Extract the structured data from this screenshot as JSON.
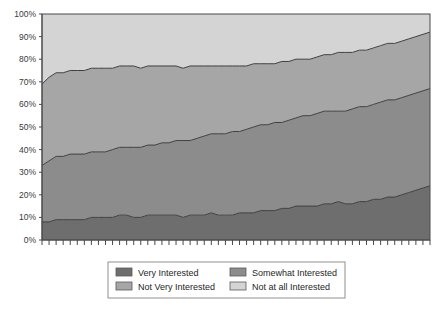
{
  "chart_data": {
    "type": "area",
    "stacked": true,
    "stack_mode": "percent",
    "title": "",
    "subtitle": "",
    "xlabel": "",
    "ylabel": "",
    "ylim": [
      0,
      100
    ],
    "ytick_labels": [
      "0%",
      "10%",
      "20%",
      "30%",
      "40%",
      "50%",
      "60%",
      "70%",
      "80%",
      "90%",
      "100%"
    ],
    "ytick_values": [
      0,
      10,
      20,
      30,
      40,
      50,
      60,
      70,
      80,
      90,
      100
    ],
    "grid": false,
    "xtick_labels": [],
    "xtick_count": 56,
    "legend_position": "bottom",
    "x": [
      1,
      2,
      3,
      4,
      5,
      6,
      7,
      8,
      9,
      10,
      11,
      12,
      13,
      14,
      15,
      16,
      17,
      18,
      19,
      20,
      21,
      22,
      23,
      24,
      25,
      26,
      27,
      28,
      29,
      30,
      31,
      32,
      33,
      34,
      35,
      36,
      37,
      38,
      39,
      40,
      41,
      42,
      43,
      44,
      45,
      46,
      47,
      48,
      49,
      50,
      51,
      52,
      53,
      54,
      55,
      56
    ],
    "series": [
      {
        "name": "Very Interested",
        "color": "#6e6e6e",
        "values": [
          8,
          8,
          9,
          9,
          9,
          9,
          9,
          10,
          10,
          10,
          10,
          11,
          11,
          10,
          10,
          11,
          11,
          11,
          11,
          11,
          10,
          11,
          11,
          11,
          12,
          11,
          11,
          11,
          12,
          12,
          12,
          13,
          13,
          13,
          14,
          14,
          15,
          15,
          15,
          15,
          16,
          16,
          17,
          16,
          16,
          17,
          17,
          18,
          18,
          19,
          19,
          20,
          21,
          22,
          23,
          24
        ]
      },
      {
        "name": "Somewhat Interested",
        "color": "#8c8c8c",
        "values": [
          25,
          27,
          28,
          28,
          29,
          29,
          29,
          29,
          29,
          29,
          30,
          30,
          30,
          31,
          31,
          31,
          31,
          32,
          32,
          33,
          34,
          33,
          34,
          35,
          35,
          36,
          36,
          37,
          36,
          37,
          38,
          38,
          38,
          39,
          38,
          39,
          39,
          40,
          40,
          41,
          41,
          41,
          40,
          41,
          42,
          42,
          42,
          42,
          43,
          43,
          43,
          43,
          43,
          43,
          43,
          43
        ]
      },
      {
        "name": "Not Very Interested",
        "color": "#a6a6a6",
        "values": [
          36,
          37,
          37,
          37,
          37,
          37,
          37,
          37,
          37,
          37,
          36,
          36,
          36,
          36,
          35,
          35,
          35,
          34,
          34,
          33,
          32,
          33,
          32,
          31,
          30,
          30,
          30,
          29,
          29,
          28,
          28,
          27,
          27,
          26,
          27,
          26,
          26,
          25,
          25,
          25,
          25,
          25,
          26,
          26,
          25,
          25,
          25,
          25,
          25,
          25,
          25,
          25,
          25,
          25,
          25,
          25
        ]
      },
      {
        "name": "Not at all Interested",
        "color": "#d4d4d4",
        "values": [
          31,
          28,
          26,
          26,
          25,
          25,
          25,
          24,
          24,
          24,
          24,
          23,
          23,
          23,
          24,
          23,
          23,
          23,
          23,
          23,
          24,
          23,
          23,
          23,
          23,
          23,
          23,
          23,
          23,
          23,
          22,
          22,
          22,
          22,
          21,
          21,
          20,
          20,
          20,
          19,
          18,
          18,
          17,
          17,
          17,
          16,
          16,
          15,
          14,
          13,
          13,
          12,
          11,
          10,
          9,
          8
        ]
      }
    ]
  },
  "legend": {
    "items": [
      {
        "label": "Very Interested",
        "color": "#6e6e6e"
      },
      {
        "label": "Somewhat Interested",
        "color": "#8c8c8c"
      },
      {
        "label": "Not Very Interested",
        "color": "#a6a6a6"
      },
      {
        "label": "Not at all Interested",
        "color": "#d4d4d4"
      }
    ]
  },
  "style": {
    "axis_color": "#4a4a4a",
    "line_color": "#3f3f3f",
    "legend_border": "#8f8f8f",
    "background": "#ffffff"
  }
}
